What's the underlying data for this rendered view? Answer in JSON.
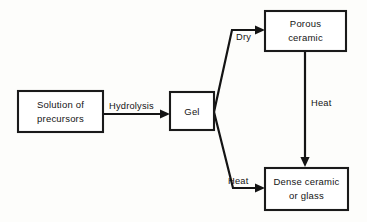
{
  "diagram": {
    "background_color": "#fdfdfb",
    "line_color": "#141414",
    "box_fill_color": "#ffffff",
    "nodes": [
      {
        "id": "solution",
        "name": "solution-of-precursors-box",
        "line1": "Solution of",
        "line2": "precursors",
        "x": 18,
        "y": 91,
        "width": 85,
        "height": 41
      },
      {
        "id": "gel",
        "name": "gel-box",
        "line1": "Gel",
        "line2": "",
        "x": 170,
        "y": 92,
        "width": 44,
        "height": 38
      },
      {
        "id": "porous",
        "name": "porous-ceramic-box",
        "line1": "Porous",
        "line2": "ceramic",
        "x": 265,
        "y": 11,
        "width": 81,
        "height": 40
      },
      {
        "id": "dense",
        "name": "dense-ceramic-or-glass-box",
        "line1": "Dense ceramic",
        "line2": "or glass",
        "x": 265,
        "y": 168,
        "width": 83,
        "height": 42
      }
    ],
    "edges": [
      {
        "id": "hydrolysis",
        "name": "hydrolysis-arrow",
        "label": "Hydrolysis",
        "label_x": 109,
        "label_y": 106,
        "path": "M 103 114 L 166 114",
        "arrow": "166,114"
      },
      {
        "id": "dry",
        "name": "dry-arrow",
        "label": "Dry",
        "label_x": 220,
        "label_y": 42,
        "path": "M 214 112 L 232 30 L 261 30",
        "arrow": "261,30"
      },
      {
        "id": "heat-branch",
        "name": "heat-branch-arrow",
        "label": "Heat",
        "label_x": 215,
        "label_y": 182,
        "path": "M 214 112 L 233 188 L 261 188",
        "arrow": "261,188"
      },
      {
        "id": "heat-vertical",
        "name": "heat-vertical-arrow",
        "label": "Heat",
        "label_x": 310,
        "label_y": 103,
        "path": "M 305 51 L 305 164",
        "arrow": "305,164"
      }
    ]
  }
}
